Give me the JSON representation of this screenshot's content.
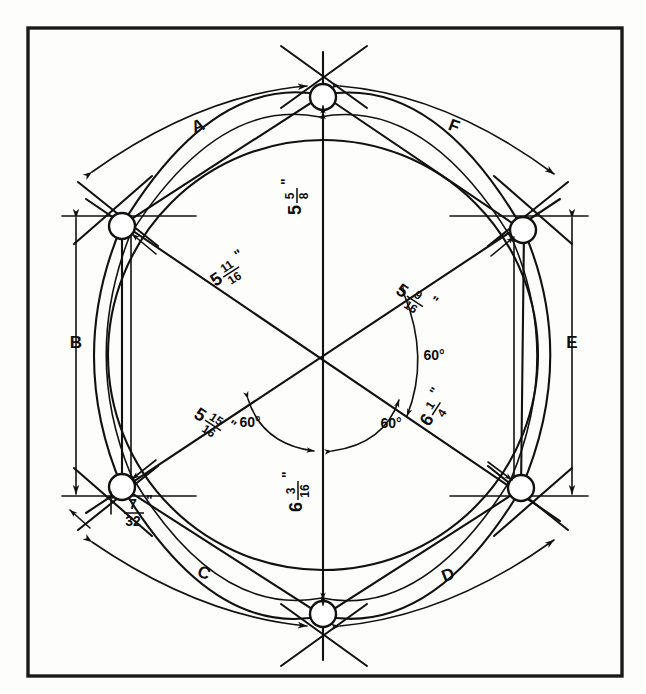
{
  "figure": {
    "frame_color": "#1a1a1a",
    "line_color": "#111111",
    "background": "#fdfdfb"
  },
  "arc_labels": [
    {
      "id": "A",
      "text": "A"
    },
    {
      "id": "B",
      "text": "B"
    },
    {
      "id": "C",
      "text": "C"
    },
    {
      "id": "D",
      "text": "D"
    },
    {
      "id": "E",
      "text": "E"
    },
    {
      "id": "F",
      "text": "F"
    }
  ],
  "dimensions": [
    {
      "id": "dim-top-vertical",
      "whole": "5",
      "num": "5",
      "den": "8",
      "unit": "\"",
      "text": "5 5/8\""
    },
    {
      "id": "dim-upper-left",
      "whole": "5",
      "num": "11",
      "den": "16",
      "unit": "\"",
      "text": "5 11/16\""
    },
    {
      "id": "dim-upper-right",
      "whole": "5",
      "num": "9",
      "den": "16",
      "unit": "\"",
      "text": "5 9/16\""
    },
    {
      "id": "dim-lower-left",
      "whole": "5",
      "num": "15",
      "den": "16",
      "unit": "\"",
      "text": "5 15/16\""
    },
    {
      "id": "dim-lower-right",
      "whole": "6",
      "num": "1",
      "den": "4",
      "unit": "\"",
      "text": "6 1/4\""
    },
    {
      "id": "dim-bottom-vertical",
      "whole": "6",
      "num": "3",
      "den": "16",
      "unit": "\"",
      "text": "6 3/16\""
    },
    {
      "id": "dim-offset-small",
      "whole": "",
      "num": "7",
      "den": "32",
      "unit": "\"",
      "text": "7/32\""
    }
  ],
  "angles": [
    {
      "id": "angle-right",
      "text": "60°"
    },
    {
      "id": "angle-bottom-left",
      "text": "60°"
    },
    {
      "id": "angle-bottom-right",
      "text": "60°"
    }
  ]
}
